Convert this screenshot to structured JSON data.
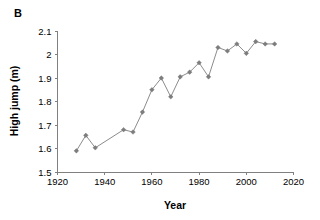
{
  "panel": {
    "label": "B"
  },
  "chart_data": {
    "type": "line",
    "title": "",
    "xlabel": "Year",
    "ylabel": "High jump (m)",
    "xlim": [
      1920,
      2020
    ],
    "ylim": [
      1.5,
      2.1
    ],
    "xticks": [
      1920,
      1940,
      1960,
      1980,
      2000,
      2020
    ],
    "yticks": [
      1.5,
      1.6,
      1.7,
      1.8,
      1.9,
      2.0,
      2.1
    ],
    "xtick_labels": [
      "1920",
      "1940",
      "1960",
      "1980",
      "2000",
      "2020"
    ],
    "ytick_labels": [
      "1.5",
      "1.6",
      "1.7",
      "1.8",
      "1.9",
      "2",
      "2.1"
    ],
    "grid": false,
    "legend": false,
    "marker": "diamond",
    "series_color": "#7d7d7d",
    "line_color": "#8c8c8c",
    "x": [
      1928,
      1932,
      1936,
      1948,
      1952,
      1956,
      1960,
      1964,
      1968,
      1972,
      1976,
      1980,
      1984,
      1988,
      1992,
      1996,
      2000,
      2004,
      2008,
      2012
    ],
    "values": [
      1.59,
      1.656,
      1.603,
      1.68,
      1.67,
      1.755,
      1.85,
      1.9,
      1.82,
      1.905,
      1.925,
      1.965,
      1.905,
      2.03,
      2.015,
      2.045,
      2.005,
      2.055,
      2.045,
      2.045
    ],
    "series": [
      {
        "name": "High jump",
        "x": [
          1928,
          1932,
          1936,
          1948,
          1952,
          1956,
          1960,
          1964,
          1968,
          1972,
          1976,
          1980,
          1984,
          1988,
          1992,
          1996,
          2000,
          2004,
          2008,
          2012
        ],
        "values": [
          1.59,
          1.656,
          1.603,
          1.68,
          1.67,
          1.755,
          1.85,
          1.9,
          1.82,
          1.905,
          1.925,
          1.965,
          1.905,
          2.03,
          2.015,
          2.045,
          2.005,
          2.055,
          2.045,
          2.045
        ]
      }
    ]
  }
}
